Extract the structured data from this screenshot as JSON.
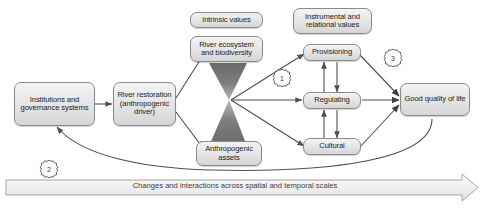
{
  "figure": {
    "background": "#ffffff",
    "node_fill": "#e8e8e8",
    "node_border": "#8a8a8a",
    "arrow_color": "#555555",
    "hourglass_color": "#6f6f6f"
  },
  "nodes": {
    "institutions": {
      "label": "Institutions and governance systems"
    },
    "restoration": {
      "label": "River restoration (anthropogenic driver)"
    },
    "intrinsic_values": {
      "label": "Intrinsic values"
    },
    "ecosystem": {
      "label": "River ecosystem and biodiversity"
    },
    "anthropogenic_assets": {
      "label": "Anthropogenic assets"
    },
    "instrumental_values": {
      "label": "Instrumental and relational values"
    },
    "provisioning": {
      "label": "Provisioning"
    },
    "regulating": {
      "label": "Regulating"
    },
    "cultural": {
      "label": "Cultural"
    },
    "good_quality": {
      "label": "Good quality of life"
    }
  },
  "badges": [
    {
      "id": "badge-1",
      "label": "1"
    },
    {
      "id": "badge-2",
      "label": "2"
    },
    {
      "id": "badge-3",
      "label": "3"
    }
  ],
  "banner": {
    "label": "Changes and interactions across spatial and temporal scales"
  }
}
